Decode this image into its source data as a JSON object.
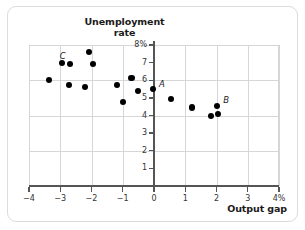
{
  "chart_data": {
    "type": "scatter",
    "title": "Unemployment rate",
    "title_lines": [
      "Unemployment",
      "rate"
    ],
    "xlabel": "Output gap",
    "ylabel": "Unemployment rate",
    "xlim": [
      -4,
      4
    ],
    "ylim": [
      0,
      8
    ],
    "grid": true,
    "legend": "none",
    "xticks": [
      -4,
      -3,
      -2,
      -1,
      0,
      1,
      2,
      3,
      4
    ],
    "xtick_labels": [
      "−4",
      "−3",
      "−2",
      "−1",
      "0",
      "1",
      "2",
      "3",
      "4%"
    ],
    "yticks": [
      1,
      2,
      3,
      4,
      5,
      6,
      7,
      8
    ],
    "ytick_labels": [
      "1",
      "2",
      "3",
      "4",
      "5",
      "6",
      "7",
      "8%"
    ],
    "points": [
      {
        "x": -3.35,
        "y": 6.0,
        "label": ""
      },
      {
        "x": -2.95,
        "y": 7.0,
        "label": "C",
        "label_dx": -2,
        "label_dy": -12
      },
      {
        "x": -2.7,
        "y": 6.9,
        "label": ""
      },
      {
        "x": -2.72,
        "y": 5.75,
        "label": ""
      },
      {
        "x": -2.22,
        "y": 5.6,
        "label": ""
      },
      {
        "x": -2.08,
        "y": 7.6,
        "label": ""
      },
      {
        "x": -1.95,
        "y": 6.9,
        "label": ""
      },
      {
        "x": -1.18,
        "y": 5.75,
        "label": ""
      },
      {
        "x": -1.0,
        "y": 4.75,
        "label": ""
      },
      {
        "x": -0.72,
        "y": 6.15,
        "label": ""
      },
      {
        "x": -0.52,
        "y": 5.4,
        "label": ""
      },
      {
        "x": -0.03,
        "y": 5.5,
        "label": "A",
        "label_dx": 6,
        "label_dy": -10
      },
      {
        "x": 0.55,
        "y": 4.95,
        "label": ""
      },
      {
        "x": 1.22,
        "y": 4.45,
        "label": ""
      },
      {
        "x": 1.82,
        "y": 3.95,
        "label": ""
      },
      {
        "x": 2.02,
        "y": 4.55,
        "label": "B",
        "label_dx": 6,
        "label_dy": -11
      },
      {
        "x": 2.05,
        "y": 4.1,
        "label": ""
      }
    ]
  },
  "colors": {
    "point": "#000000",
    "axis": "#555555",
    "grid": "#d6d6d6",
    "card_border": "#dcdcdc",
    "text": "#1a1a1a"
  }
}
